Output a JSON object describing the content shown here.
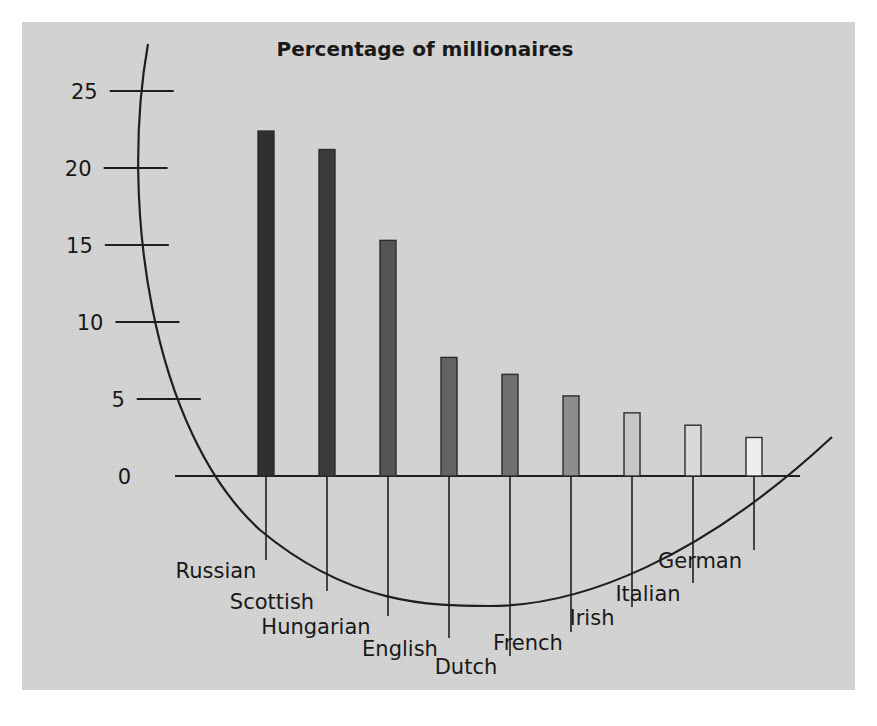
{
  "figure": {
    "background_color": "#ffffff",
    "panel_color": "#d5d5d5",
    "panel": {
      "x": 22,
      "y": 22,
      "width": 833,
      "height": 668
    }
  },
  "chart_data": {
    "type": "bar",
    "title": "Percentage of millionaires",
    "xlabel": "",
    "ylabel": "",
    "ylim": [
      0,
      27
    ],
    "yticks": [
      "0",
      "5",
      "10",
      "15",
      "20",
      "25"
    ],
    "ytick_values": [
      0,
      5,
      10,
      15,
      20,
      25
    ],
    "grid": false,
    "legend": "none",
    "categories": [
      "Russian",
      "Scottish",
      "Hungarian",
      "English",
      "Dutch",
      "French",
      "Irish",
      "Italian",
      "German"
    ],
    "values": [
      22.4,
      21.2,
      15.3,
      7.7,
      6.6,
      5.2,
      4.1,
      3.3,
      2.5
    ],
    "bar_colors": [
      "#2e2e2e",
      "#3a3a3a",
      "#545454",
      "#636363",
      "#6f6f6f",
      "#8e8e8e",
      "#c9c9c9",
      "#dcdcdc",
      "#f2f2f2"
    ],
    "annotations": {
      "axis_style": "curved-arc y-axis with leader lines to staggered category labels"
    }
  },
  "geometry": {
    "baseline_y": 476,
    "px_per_unit": 15.4,
    "bar_width": 16,
    "bar_x": [
      258,
      319,
      380,
      441,
      502,
      563,
      624,
      685,
      746
    ],
    "label_x": [
      216,
      272,
      316,
      400,
      466,
      528,
      592,
      648,
      700
    ],
    "label_y": [
      578,
      609,
      634,
      656,
      674,
      650,
      625,
      601,
      568
    ],
    "leader_bottom": [
      560,
      591,
      616,
      638,
      656,
      632,
      607,
      583,
      550
    ],
    "axis_x_left": 175,
    "axis_x_right": 800
  }
}
